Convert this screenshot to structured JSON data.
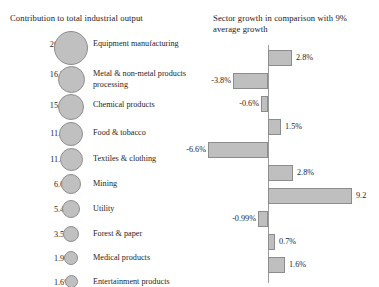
{
  "left_panel": {
    "title": "Contribution to total industrial output"
  },
  "right_panel": {
    "title": "Sector growth in comparison with 9% average growth"
  },
  "chart_data": [
    {
      "type": "bubble",
      "title": "Contribution to total industrial output",
      "xlabel": "",
      "ylabel": "",
      "legend": "none",
      "grid": false,
      "categories": [
        "Equipment manufacturing",
        "Metal & non-metal products processing",
        "Chemical products",
        "Food & tobacco",
        "Textiles & clothing",
        "Mining",
        "Utility",
        "Forest & paper",
        "Medical products",
        "Entertainment products"
      ],
      "value_labels": [
        "26.1%",
        "16.5%",
        "15.2%",
        "11.8%",
        "11.4%",
        "6.6%",
        "5.4%",
        "3.5%",
        "1.9%",
        "1.6%"
      ],
      "values": [
        26.1,
        16.5,
        15.2,
        11.8,
        11.4,
        6.6,
        5.4,
        3.5,
        1.9,
        1.6
      ],
      "unit": "%"
    },
    {
      "type": "bar",
      "orientation": "horizontal",
      "title": "Sector growth in comparison with 9% average growth",
      "xlabel": "",
      "ylabel": "",
      "legend": "none",
      "grid": false,
      "reference_line": 0,
      "categories": [
        "Equipment manufacturing",
        "Metal & non-metal products processing",
        "Chemical products",
        "Food & tobacco",
        "Textiles & clothing",
        "Mining",
        "Utility",
        "Forest & paper",
        "Medical products",
        "Entertainment products"
      ],
      "values": [
        2.8,
        -3.8,
        -0.6,
        1.5,
        -6.6,
        2.8,
        9.2,
        -0.99,
        0.7,
        1.6
      ],
      "value_labels": [
        "2.8%",
        "-3.8%",
        "-0.6%",
        "1.5%",
        "-6.6%",
        "2.8%",
        "9.2",
        "-0.99%",
        "0.7%",
        "1.6%"
      ],
      "unit": "%"
    }
  ],
  "bubbles": [
    {
      "pct": "26.1%",
      "label": "Equipment manufacturing",
      "size": 34,
      "top": 3,
      "label_top": 11
    },
    {
      "pct": "16.5%",
      "label": "Metal & non-metal products\nprocessing",
      "size": 27,
      "top": 38,
      "label_top": 41
    },
    {
      "pct": "15.2%",
      "label": "Chemical products",
      "size": 26,
      "top": 66,
      "label_top": 72
    },
    {
      "pct": "11.8%",
      "label": "Food & tobacco",
      "size": 24,
      "top": 94,
      "label_top": 100
    },
    {
      "pct": "11.4%",
      "label": "Textiles & clothing",
      "size": 23,
      "top": 120,
      "label_top": 126
    },
    {
      "pct": "6.6%",
      "label": "Mining",
      "size": 20,
      "top": 146,
      "label_top": 151
    },
    {
      "pct": "5.4%",
      "label": "Utility",
      "size": 18,
      "top": 172,
      "label_top": 176
    },
    {
      "pct": "3.5%",
      "label": "Forest & paper",
      "size": 16,
      "top": 198,
      "label_top": 201
    },
    {
      "pct": "1.9%",
      "label": "Medical products",
      "size": 14,
      "top": 223,
      "label_top": 225
    },
    {
      "pct": "1.6%",
      "label": "Entertainment products",
      "size": 13,
      "top": 247,
      "label_top": 249
    }
  ],
  "bars": [
    {
      "value_label": "2.8%",
      "top": 10,
      "side": "right",
      "length": 24
    },
    {
      "value_label": "-3.8%",
      "top": 33,
      "side": "left",
      "length": 35
    },
    {
      "value_label": "-0.6%",
      "top": 56,
      "side": "left",
      "length": 7
    },
    {
      "value_label": "1.5%",
      "top": 79,
      "side": "right",
      "length": 13
    },
    {
      "value_label": "-6.6%",
      "top": 102,
      "side": "left",
      "length": 60
    },
    {
      "value_label": "2.8%",
      "top": 125,
      "side": "right",
      "length": 25
    },
    {
      "value_label": "9.2",
      "top": 148,
      "side": "right",
      "length": 84
    },
    {
      "value_label": "-0.99%",
      "top": 171,
      "side": "left",
      "length": 10
    },
    {
      "value_label": "0.7%",
      "top": 194,
      "side": "right",
      "length": 7
    },
    {
      "value_label": "1.6%",
      "top": 217,
      "side": "right",
      "length": 17
    }
  ],
  "colors": {
    "bubble_fill": "#c0c0c0",
    "bubble_stroke": "#8e8e8e",
    "bar_fill": "#bfbfbf",
    "bar_stroke": "#8c8c8c",
    "axis": "#9b9b9b",
    "text": "#26251f",
    "background": "#ffffff"
  }
}
